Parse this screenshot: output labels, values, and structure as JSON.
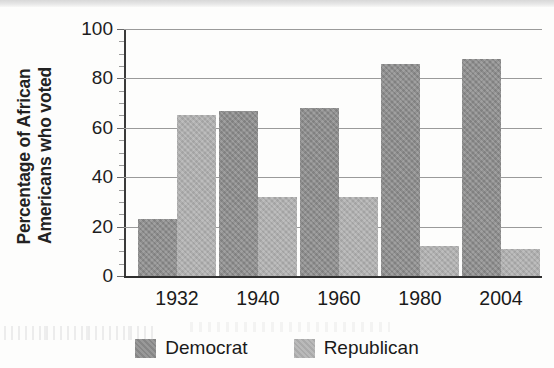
{
  "chart_data": {
    "type": "bar",
    "title": "",
    "subtitle": "",
    "xlabel": "",
    "ylabel": "Percentage of African Americans who voted",
    "ylabel_lines": [
      "Percentage of African",
      "Americans who voted"
    ],
    "categories": [
      "1932",
      "1940",
      "1960",
      "1980",
      "2004"
    ],
    "series": [
      {
        "name": "Democrat",
        "color": "#8d8d8d",
        "values": [
          23,
          67,
          68,
          86,
          88
        ]
      },
      {
        "name": "Republican",
        "color": "#aeaeae",
        "values": [
          65,
          32,
          32,
          12,
          11
        ]
      }
    ],
    "ylim": [
      0,
      100
    ],
    "ytick_labels": [
      "0",
      "20",
      "40",
      "60",
      "80",
      "100"
    ],
    "ytick_values": [
      0,
      20,
      40,
      60,
      80,
      100
    ],
    "yminor_step": 5,
    "grid": "horizontal",
    "legend_position": "bottom",
    "legend": [
      {
        "label": "Democrat",
        "color": "#8d8d8d"
      },
      {
        "label": "Republican",
        "color": "#aeaeae"
      }
    ]
  },
  "colors": {
    "democrat": "#8d8d8d",
    "republican": "#aeaeae",
    "axis": "#2f2f2f",
    "grid": "#9a9a9a",
    "text": "#1a1a1a",
    "background": "#fdfdfc"
  }
}
